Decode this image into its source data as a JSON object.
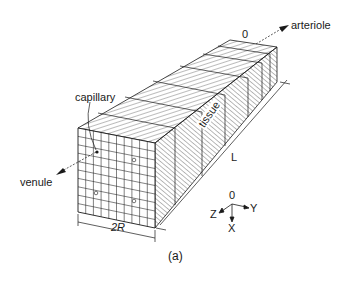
{
  "figure": {
    "caption": "(a)",
    "labels": {
      "capillary": "capillary",
      "venule": "venule",
      "arteriole": "arteriole",
      "tissue": "tissue",
      "origin": "0",
      "length": "L",
      "width": "2R"
    },
    "axes": {
      "origin": "0",
      "x": "X",
      "y": "Y",
      "z": "Z"
    }
  },
  "colors": {
    "line": "#1a1a1a",
    "background": "#ffffff"
  }
}
